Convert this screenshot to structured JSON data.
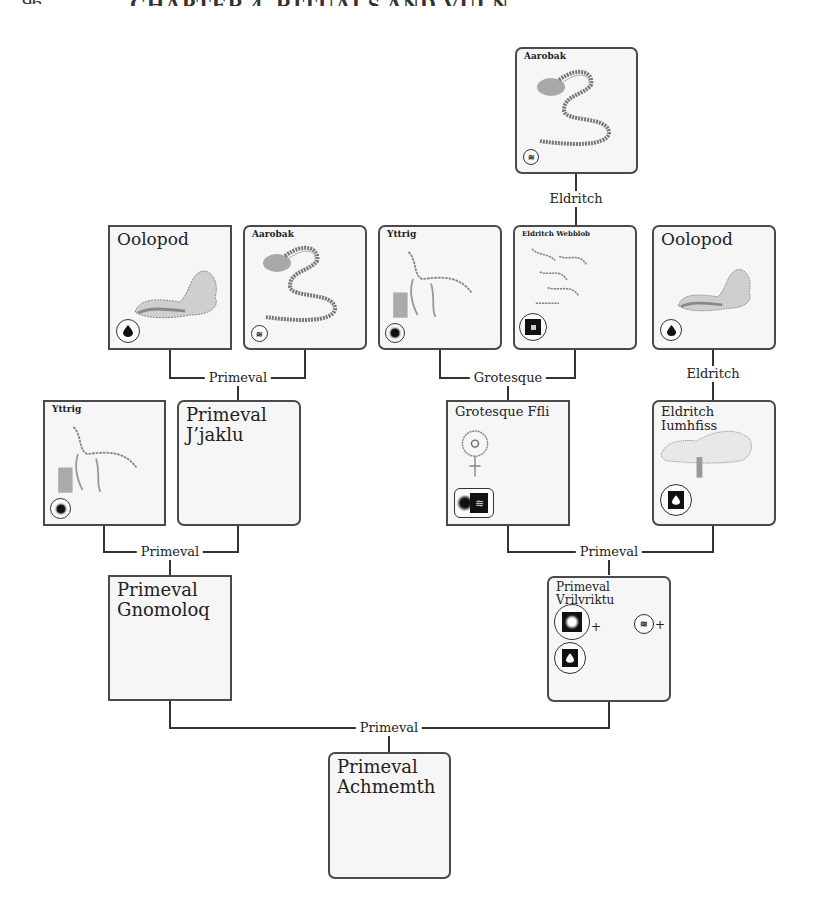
{
  "page": {
    "header_text": "CHAPTER 4. RITUALS AND VULNERABILITIES",
    "page_number": "96"
  },
  "colors": {
    "line": "#333333",
    "card_border": "#4a4a4a",
    "card_fill": "#f6f6f6",
    "icon_fill": "#111111"
  },
  "cards": {
    "top_aarobak": {
      "title": "Aarobak",
      "icon": "wave-icon"
    },
    "oolopod_left": {
      "title": "Oolopod",
      "icon": "drop-icon"
    },
    "aarobak_left": {
      "title": "Aarobak",
      "icon": "wave-icon"
    },
    "yttrig_mid": {
      "title": "Yttrig",
      "icon": "sun-icon"
    },
    "eldritch_webblob": {
      "title": "Eldritch Webblob",
      "icon": "square-icon"
    },
    "oolopod_right": {
      "title": "Oolopod",
      "icon": "drop-icon"
    },
    "yttrig_left": {
      "title": "Yttrig",
      "icon": "sun-icon"
    },
    "primeval_jjaklu": {
      "title_line1": "Primeval",
      "title_line2": "J’jaklu"
    },
    "grotesque_ffli": {
      "title": "Grotesque Ffli",
      "icons": [
        "sun-icon",
        "wave-icon"
      ]
    },
    "eldritch_iumhfiss": {
      "title": "Eldritch Iumhfiss",
      "icon": "drop-icon"
    },
    "primeval_gnomoloq": {
      "title_line1": "Primeval",
      "title_line2": "Gnomoloq"
    },
    "primeval_vrilvriktu": {
      "title": "Primeval Vrilvriktu",
      "icons": [
        "sun-icon",
        "wave-icon",
        "drop-icon"
      ],
      "plus": "+"
    },
    "primeval_achmemth": {
      "title_line1": "Primeval",
      "title_line2": "Achmemth"
    }
  },
  "connectors": {
    "top_eldritch": "Eldritch",
    "left_primeval_1": "Primeval",
    "mid_grotesque": "Grotesque",
    "right_eldritch": "Eldritch",
    "left_primeval_2": "Primeval",
    "right_primeval": "Primeval",
    "bottom_primeval": "Primeval"
  }
}
